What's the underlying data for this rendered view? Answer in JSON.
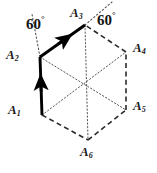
{
  "figure": {
    "type": "geometry-diagram",
    "canvas": {
      "width": 157,
      "height": 173,
      "background": "#ffffff"
    },
    "colors": {
      "stroke": "#1a1a1a",
      "bold_vector": "#000000",
      "dashed_edge": "#2b2b2b",
      "dotted_diagonal": "#555555",
      "text": "#141414"
    },
    "center": {
      "x": 84,
      "y": 83
    },
    "vertices": [
      {
        "id": "A1",
        "label": "A",
        "sub": "1",
        "x": 42,
        "y": 115,
        "label_x": 8,
        "label_y": 103
      },
      {
        "id": "A2",
        "label": "A",
        "sub": "2",
        "x": 40,
        "y": 57,
        "label_x": 6,
        "label_y": 48
      },
      {
        "id": "A3",
        "label": "A",
        "sub": "3",
        "x": 85,
        "y": 25,
        "label_x": 70,
        "label_y": 6
      },
      {
        "id": "A4",
        "label": "A",
        "sub": "4",
        "x": 126,
        "y": 52,
        "label_x": 133,
        "label_y": 41
      },
      {
        "id": "A5",
        "label": "A",
        "sub": "5",
        "x": 126,
        "y": 110,
        "label_x": 133,
        "label_y": 99
      },
      {
        "id": "A6",
        "label": "A",
        "sub": "6",
        "x": 88,
        "y": 140,
        "label_x": 80,
        "label_y": 145
      }
    ],
    "vectors": [
      {
        "id": "v1",
        "from": "A1",
        "to": "A2",
        "style": "bold-arrow",
        "arrow_at": "mid"
      },
      {
        "id": "v2",
        "from": "A2",
        "to": "A3",
        "style": "bold-arrow",
        "arrow_at": "mid"
      }
    ],
    "dashed_edges": [
      {
        "from": "A1",
        "to": "A6"
      },
      {
        "from": "A6",
        "to": "A5"
      },
      {
        "from": "A5",
        "to": "A4"
      },
      {
        "from": "A4",
        "to": "A3"
      }
    ],
    "dotted_diagonals": [
      {
        "from": "A1",
        "to": "A4"
      },
      {
        "from": "A2",
        "to": "A5"
      },
      {
        "from": "A3",
        "to": "A6"
      }
    ],
    "angle_marks": [
      {
        "id": "angle-left",
        "value": "60",
        "unit": "°",
        "label_x": 26,
        "label_y": 16,
        "ray": {
          "x1": 40,
          "y1": 57,
          "x2": 32,
          "y2": 14
        },
        "at_vertex": "A2"
      },
      {
        "id": "angle-right",
        "value": "60",
        "unit": "°",
        "label_x": 97,
        "label_y": 12,
        "ray": {
          "x1": 85,
          "y1": 25,
          "x2": 112,
          "y2": 2
        },
        "at_vertex": "A3"
      }
    ]
  }
}
